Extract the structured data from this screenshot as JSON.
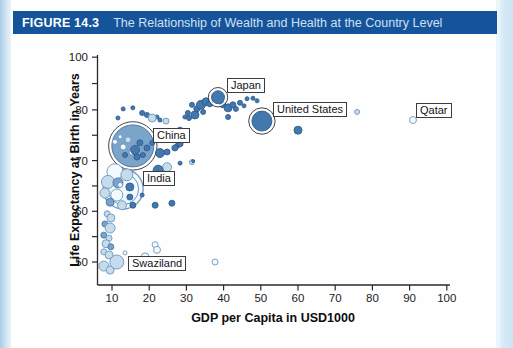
{
  "figure_header": {
    "label": "FIGURE 14.3",
    "title": "The Relationship of Wealth and Health at the Country Level",
    "bar_color": "#15549b"
  },
  "chart_data": {
    "type": "scatter",
    "title": "The Relationship of Wealth and Health at the Country Level",
    "xlabel": "GDP per Capita in USD1000",
    "ylabel": "Life Expectancy at Birth in Years",
    "x_ticks": [
      10,
      20,
      30,
      40,
      50,
      60,
      70,
      80,
      90,
      100
    ],
    "y_ticks": [
      {
        "pos": 50,
        "label": "50"
      },
      {
        "pos": 55
      },
      {
        "pos": 60,
        "label": "60"
      },
      {
        "pos": 65
      },
      {
        "pos": 70,
        "label": "70"
      },
      {
        "pos": 75
      },
      {
        "pos": 80,
        "label": "80"
      },
      {
        "pos": 85.2
      },
      {
        "pos": 90.4,
        "label": "100"
      }
    ],
    "xlim": [
      6,
      101
    ],
    "ylim": [
      45.5,
      90.5
    ],
    "grid": false,
    "legend": "none",
    "colors": {
      "dark_fill": "#4478ad",
      "dark_stroke": "#2d5e92",
      "medium_fill": "#7aa3cb",
      "medium_stroke": "#4878a8",
      "light_fill": "#c6dbec",
      "light_stroke": "#6b96bf",
      "open_fill": "#f4f9fd",
      "open_stroke": "#6b96bf",
      "ring_stroke": "#3f4347",
      "axis": "#2a2a2a"
    },
    "countries": [
      {
        "name": "China",
        "gdp": 15.6,
        "life": 72.9,
        "r": 21,
        "style": "big-filled"
      },
      {
        "name": "India",
        "gdp": 13.0,
        "life": 64.4,
        "r": 20,
        "style": "big-open"
      },
      {
        "name": "Japan",
        "gdp": 38.5,
        "life": 82.5,
        "r": 6.5,
        "style": "dark-ring"
      },
      {
        "name": "United States",
        "gdp": 50.3,
        "life": 77.8,
        "r": 10,
        "style": "dark-ring"
      },
      {
        "name": "Qatar",
        "gdp": 90.9,
        "life": 78.0,
        "r": 3.5,
        "style": "open"
      },
      {
        "name": "Swaziland",
        "gdp": 11.3,
        "life": 50.0,
        "r": 7,
        "style": "light"
      }
    ],
    "bubbles": [
      [
        29.6,
        78.6,
        2,
        "d"
      ],
      [
        30.4,
        79.4,
        2.5,
        "d"
      ],
      [
        31.5,
        81,
        2.5,
        "d"
      ],
      [
        32.8,
        80.2,
        3,
        "d"
      ],
      [
        33.9,
        81,
        4.5,
        "d"
      ],
      [
        35.3,
        81.6,
        4,
        "d"
      ],
      [
        36.3,
        81.2,
        3,
        "d"
      ],
      [
        34.5,
        79.6,
        2.5,
        "d"
      ],
      [
        32.3,
        79,
        4,
        "d"
      ],
      [
        39.8,
        81,
        3,
        "d"
      ],
      [
        41.2,
        80.4,
        4,
        "d"
      ],
      [
        42.5,
        81,
        3,
        "d"
      ],
      [
        43.3,
        80.2,
        2.5,
        "d"
      ],
      [
        44.4,
        81.4,
        2.5,
        "d"
      ],
      [
        45.5,
        80.8,
        2,
        "d"
      ],
      [
        41.2,
        78.6,
        2.5,
        "d"
      ],
      [
        46.3,
        82.2,
        2,
        "d"
      ],
      [
        47.9,
        82.3,
        2,
        "d"
      ],
      [
        49,
        81.8,
        2,
        "d"
      ],
      [
        19.4,
        79,
        2.5,
        "d"
      ],
      [
        22.1,
        78.6,
        2,
        "d"
      ],
      [
        24.5,
        77.8,
        3,
        "lt"
      ],
      [
        22.9,
        78,
        2,
        "d"
      ],
      [
        26.4,
        75,
        4,
        "d"
      ],
      [
        28.3,
        76,
        3,
        "d"
      ],
      [
        27.5,
        72.9,
        2.5,
        "d"
      ],
      [
        22.9,
        71.5,
        4.5,
        "d"
      ],
      [
        24.8,
        71.7,
        3,
        "d"
      ],
      [
        26.9,
        72.5,
        3,
        "d"
      ],
      [
        28.3,
        73.3,
        3,
        "d"
      ],
      [
        30.7,
        78.4,
        2.5,
        "d"
      ],
      [
        31.5,
        69.7,
        2.5,
        "lt"
      ],
      [
        24.8,
        68.7,
        4.5,
        "lt"
      ],
      [
        22.4,
        68.1,
        5,
        "d"
      ],
      [
        28.3,
        69.5,
        2,
        "d"
      ],
      [
        31.8,
        69.9,
        1.5,
        "d"
      ],
      [
        26.1,
        61.6,
        3,
        "d"
      ],
      [
        21.6,
        61.2,
        3,
        "d"
      ],
      [
        21.6,
        53.4,
        3,
        "o"
      ],
      [
        37.7,
        50,
        3,
        "o"
      ],
      [
        60,
        76,
        4,
        "d"
      ],
      [
        75.9,
        79.6,
        2.5,
        "lt"
      ],
      [
        13,
        80.2,
        2,
        "d"
      ],
      [
        15.6,
        80.4,
        2,
        "d"
      ],
      [
        18.1,
        79.4,
        2.5,
        "d"
      ],
      [
        20.8,
        78.4,
        4,
        "lt"
      ],
      [
        11.6,
        78.4,
        2,
        "d"
      ],
      [
        10.8,
        73.7,
        2.5,
        "o"
      ],
      [
        12.2,
        74.7,
        2,
        "o"
      ],
      [
        13,
        72.7,
        3,
        "o"
      ],
      [
        15.4,
        71.7,
        3,
        "o"
      ],
      [
        17.5,
        73.5,
        3,
        "d"
      ],
      [
        19.4,
        72.5,
        3,
        "d"
      ],
      [
        13.5,
        71.1,
        2.5,
        "d"
      ],
      [
        16.7,
        70.7,
        3,
        "d"
      ],
      [
        18.3,
        71.1,
        2.5,
        "d"
      ],
      [
        20.8,
        73.5,
        2.5,
        "d"
      ],
      [
        14.3,
        74.1,
        3,
        "lt"
      ],
      [
        16.2,
        72.1,
        4.5,
        "d"
      ],
      [
        10.8,
        67.8,
        8,
        "o"
      ],
      [
        14,
        67.2,
        6,
        "lt"
      ],
      [
        8.9,
        65.8,
        6.5,
        "lt"
      ],
      [
        11.6,
        65.6,
        5,
        "m"
      ],
      [
        14.8,
        64.8,
        4,
        "d"
      ],
      [
        8.1,
        63.6,
        5,
        "lt"
      ],
      [
        11.3,
        63.2,
        6,
        "o"
      ],
      [
        14.8,
        62.8,
        3,
        "d"
      ],
      [
        18.1,
        63.2,
        2,
        "d"
      ],
      [
        9.5,
        61.8,
        4,
        "m"
      ],
      [
        12.7,
        61.2,
        4.5,
        "lt"
      ],
      [
        15.6,
        61.2,
        3,
        "d"
      ],
      [
        12.2,
        65.2,
        2.5,
        "o"
      ],
      [
        8.7,
        59.5,
        3,
        "lt"
      ],
      [
        9.7,
        58.7,
        4,
        "lt"
      ],
      [
        8.1,
        57.5,
        3,
        "m"
      ],
      [
        9.5,
        56.7,
        5,
        "lt"
      ],
      [
        7.8,
        55.3,
        3,
        "m"
      ],
      [
        9.2,
        54.7,
        3,
        "lt"
      ],
      [
        8.4,
        53.6,
        4,
        "lt"
      ],
      [
        9.7,
        53,
        3,
        "m"
      ],
      [
        7.8,
        52,
        3,
        "lt"
      ],
      [
        9.2,
        51.4,
        4,
        "lt"
      ],
      [
        7.8,
        49.2,
        5,
        "lt"
      ],
      [
        9.5,
        48.4,
        4,
        "lt"
      ],
      [
        13.5,
        51.8,
        2,
        "o"
      ],
      [
        18.9,
        51,
        4,
        "o"
      ],
      [
        22.1,
        52.4,
        3.5,
        "o"
      ],
      [
        15.1,
        49.2,
        2,
        "lt"
      ]
    ]
  }
}
